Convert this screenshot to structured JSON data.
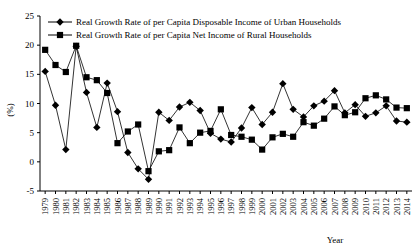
{
  "chart_data": {
    "type": "line",
    "title": "",
    "xlabel": "Year",
    "ylabel": "(%)",
    "ylim": [
      -5,
      25
    ],
    "yticks": [
      -5,
      0,
      5,
      10,
      15,
      20,
      25
    ],
    "grid": false,
    "legend_position": "top-left",
    "x": [
      1979,
      1980,
      1981,
      1982,
      1983,
      1984,
      1985,
      1986,
      1987,
      1988,
      1989,
      1990,
      1991,
      1992,
      1993,
      1994,
      1995,
      1996,
      1997,
      1998,
      1999,
      2000,
      2001,
      2002,
      2003,
      2004,
      2005,
      2006,
      2007,
      2008,
      2009,
      2010,
      2011,
      2012,
      2013,
      2014
    ],
    "categories": [
      "1979",
      "1980",
      "1981",
      "1982",
      "1983",
      "1984",
      "1985",
      "1986",
      "1987",
      "1988",
      "1989",
      "1990",
      "1991",
      "1992",
      "1993",
      "1994",
      "1995",
      "1996",
      "1997",
      "1998",
      "1999",
      "2000",
      "2001",
      "2002",
      "2003",
      "2004",
      "2005",
      "2006",
      "2007",
      "2008",
      "2009",
      "2010",
      "2011",
      "2012",
      "2013",
      "2014"
    ],
    "series": [
      {
        "name": "Real Growth Rate of per Capita Disposable Income of Urban Households",
        "marker": "diamond",
        "values": [
          15.5,
          9.7,
          2.1,
          19.8,
          11.9,
          5.9,
          13.5,
          8.6,
          1.6,
          -1.2,
          -3.0,
          8.5,
          7.1,
          9.4,
          10.2,
          8.8,
          4.9,
          3.9,
          3.4,
          5.8,
          9.3,
          6.4,
          8.5,
          13.4,
          9.0,
          7.7,
          9.6,
          10.4,
          12.2,
          8.4,
          9.8,
          7.8,
          8.4,
          9.6,
          7.0,
          6.8
        ]
      },
      {
        "name": "Real Growth Rate of per Capita Net Income of Rural Households",
        "marker": "square",
        "values": [
          19.2,
          16.6,
          15.4,
          19.9,
          14.5,
          14.0,
          11.8,
          3.2,
          5.2,
          6.4,
          -1.6,
          1.8,
          2.0,
          5.9,
          3.2,
          5.0,
          5.3,
          9.0,
          4.6,
          4.3,
          3.8,
          2.1,
          4.2,
          4.8,
          4.3,
          6.8,
          6.2,
          7.4,
          9.5,
          8.0,
          8.5,
          10.9,
          11.4,
          10.7,
          9.3,
          9.2
        ]
      }
    ]
  },
  "legend": {
    "items": [
      {
        "label": "Real Growth Rate of per Capita Disposable Income of Urban Households",
        "marker": "diamond"
      },
      {
        "label": "Real Growth Rate of per Capita Net Income of Rural Households",
        "marker": "square"
      }
    ]
  },
  "axis": {
    "y_title": "(%)",
    "x_title": "Year"
  },
  "colors": {
    "line": "#000000",
    "background": "#ffffff"
  }
}
